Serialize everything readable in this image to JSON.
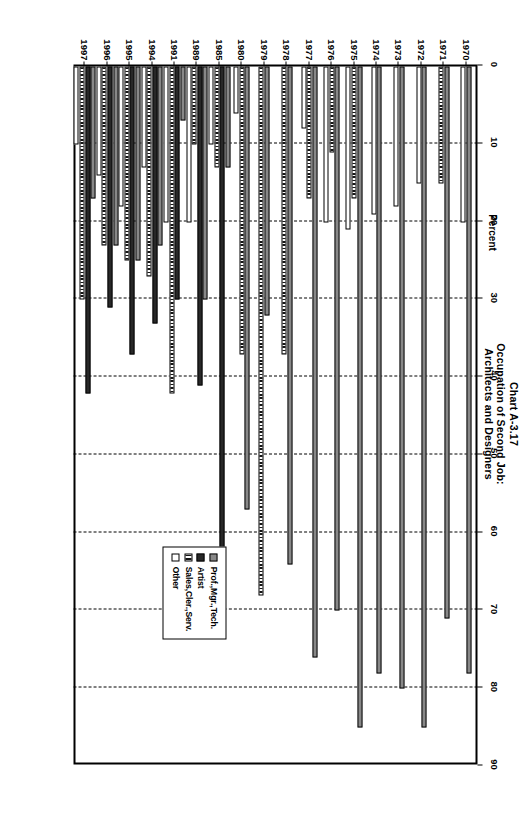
{
  "title": {
    "line1": "Chart A-3.17",
    "line2": "Occupation of Second Job:",
    "line3": "Architects and Designers"
  },
  "legend": {
    "items": [
      {
        "label": "Prof.,Mgr.,Tech.",
        "swatch": "checker-gray"
      },
      {
        "label": "Artist",
        "swatch": "solid-dark"
      },
      {
        "label": "Sales,Cler.,Serv.",
        "swatch": "striped"
      },
      {
        "label": "Other",
        "swatch": "white"
      }
    ]
  },
  "chart_data": {
    "type": "bar",
    "orientation": "horizontal",
    "title": "Chart A-3.17 Occupation of Second Job: Architects and Designers",
    "xlabel": "Percent",
    "ylabel": "",
    "xlim": [
      0,
      90
    ],
    "xticks": [
      0,
      10,
      20,
      30,
      40,
      50,
      60,
      70,
      80,
      90
    ],
    "grid": "vertical-dashed",
    "legend_position": "bottom-right",
    "categories": [
      "1970",
      "1971",
      "1972",
      "1973",
      "1974",
      "1975",
      "1976",
      "1977",
      "1978",
      "1979",
      "1980",
      "1985",
      "1989",
      "1991",
      "1994",
      "1995",
      "1996",
      "1997"
    ],
    "series": [
      {
        "name": "Prof.,Mgr.,Tech.",
        "values": [
          78,
          71,
          85,
          80,
          78,
          85,
          70,
          76,
          64,
          32,
          57,
          13,
          30,
          7,
          23,
          25,
          23,
          17
        ]
      },
      {
        "name": "Artist",
        "values": [
          0,
          0,
          0,
          0,
          0,
          0,
          0,
          0,
          0,
          0,
          0,
          65,
          41,
          30,
          33,
          37,
          31,
          42
        ]
      },
      {
        "name": "Sales,Cler.,Serv.",
        "values": [
          0,
          15,
          0,
          0,
          0,
          17,
          11,
          17,
          37,
          68,
          37,
          13,
          10,
          42,
          27,
          25,
          23,
          30
        ]
      },
      {
        "name": "Other",
        "values": [
          20,
          0,
          15,
          18,
          19,
          21,
          20,
          8,
          0,
          0,
          6,
          10,
          20,
          20,
          13,
          18,
          14,
          10
        ]
      }
    ]
  }
}
